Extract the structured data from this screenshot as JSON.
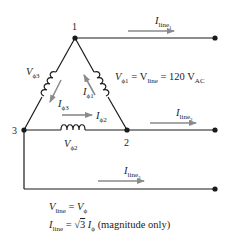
{
  "diagram": {
    "colors": {
      "wire": "#1a1a1a",
      "arrow": "#8a8a8a",
      "text": "#222222"
    },
    "nodes": [
      {
        "id": "1",
        "label": "1"
      },
      {
        "id": "2",
        "label": "2"
      },
      {
        "id": "3",
        "label": "3"
      }
    ],
    "windings": {
      "phi1": {
        "symbol": "V",
        "sub": "ϕ1",
        "equation_rest": " = V",
        "equation_sub2": "line",
        "equation_tail": " = 120 V",
        "equation_sub3": "AC"
      },
      "phi2": {
        "symbol": "V",
        "sub": "ϕ2"
      },
      "phi3": {
        "symbol": "V",
        "sub": "ϕ3"
      }
    },
    "phase_currents": {
      "i_phi1": {
        "symbol": "I",
        "sub": "ϕ1"
      },
      "i_phi2": {
        "symbol": "I",
        "sub": "ϕ2"
      },
      "i_phi3": {
        "symbol": "I",
        "sub": "ϕ3"
      }
    },
    "line_currents": {
      "line1": {
        "symbol": "I",
        "sub": "line",
        "subsub": "1"
      },
      "line2": {
        "symbol": "I",
        "sub": "line",
        "subsub": "2"
      },
      "line3": {
        "symbol": "I",
        "sub": "line",
        "subsub": "3"
      }
    },
    "equations": {
      "eq1": {
        "lhs": "V",
        "lhs_sub": "line",
        "eq": " = ",
        "rhs": "V",
        "rhs_sub": "ϕ"
      },
      "eq2": {
        "lhs": "I",
        "lhs_sub": "line",
        "eq": " = ",
        "sqrt": "√",
        "root": "3",
        "rhs": " I",
        "rhs_sub": "ϕ",
        "note": " (magnitude only)"
      }
    }
  }
}
